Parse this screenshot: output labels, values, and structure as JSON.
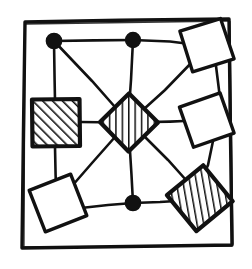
{
  "figure": {
    "title": "Hand-drawn graph of nine nodes on a three-by-three lattice",
    "caption": "",
    "width": 252,
    "height": 269,
    "background_color": "#ffffff",
    "ink_color": "#111111"
  },
  "frame": {
    "name": "hand-drawn outer border",
    "stroke_color": "#111111",
    "stroke_width": 3.2,
    "points": "25,22 229,19 232,245 22,248"
  },
  "style": {
    "edge_color": "#111111",
    "edge_width": 2.6,
    "node_outline_color": "#111111",
    "node_outline_width": 3.4,
    "hatch_color": "#111111",
    "hatch_width": 2.4,
    "white_fill": "#ffffff",
    "circle_fill": "#111111"
  },
  "nodes": [
    {
      "id": "n1",
      "label": "top-left circle node",
      "shape": "circle",
      "fill": "solid-black",
      "cx": 54,
      "cy": 41,
      "r": 7.5
    },
    {
      "id": "n2",
      "label": "top-center circle node",
      "shape": "circle",
      "fill": "solid-black",
      "cx": 133,
      "cy": 40,
      "r": 7.5
    },
    {
      "id": "n3",
      "label": "top-right white square node",
      "shape": "square",
      "fill": "white",
      "cx": 207,
      "cy": 45,
      "size": 44,
      "rotation": -18
    },
    {
      "id": "n4",
      "label": "left-middle hatched square node",
      "shape": "square",
      "fill": "hatched",
      "hatch_angle": 45,
      "cx": 56,
      "cy": 123,
      "size": 47,
      "rotation": 0
    },
    {
      "id": "n5",
      "label": "center hatched diamond node",
      "shape": "square",
      "fill": "hatched",
      "hatch_angle": 90,
      "cx": 129,
      "cy": 122,
      "size": 41,
      "rotation": 45
    },
    {
      "id": "n6",
      "label": "right-middle white square node",
      "shape": "square",
      "fill": "white",
      "cx": 207,
      "cy": 120,
      "size": 44,
      "rotation": -20
    },
    {
      "id": "n7",
      "label": "bottom-left white square node",
      "shape": "square",
      "fill": "white",
      "cx": 58,
      "cy": 203,
      "size": 45,
      "rotation": -22
    },
    {
      "id": "n8",
      "label": "bottom-center circle node",
      "shape": "circle",
      "fill": "solid-black",
      "cx": 133,
      "cy": 203,
      "r": 7.5
    },
    {
      "id": "n9",
      "label": "bottom-right hatched square node",
      "shape": "square",
      "fill": "hatched",
      "hatch_angle": 70,
      "cx": 200,
      "cy": 198,
      "size": 47,
      "rotation": -40
    }
  ],
  "edges": [
    {
      "id": "e1",
      "label": "top-left to top-center",
      "from": "n1",
      "to": "n2"
    },
    {
      "id": "e2",
      "label": "top-center to top-right",
      "from": "n2",
      "to": "n3"
    },
    {
      "id": "e3",
      "label": "top-left to left-middle",
      "from": "n1",
      "to": "n4"
    },
    {
      "id": "e4",
      "label": "top-center to center",
      "from": "n2",
      "to": "n5"
    },
    {
      "id": "e5",
      "label": "top-right to right-middle",
      "from": "n3",
      "to": "n6"
    },
    {
      "id": "e6",
      "label": "left-middle to center",
      "from": "n4",
      "to": "n5"
    },
    {
      "id": "e7",
      "label": "center to right-middle",
      "from": "n5",
      "to": "n6"
    },
    {
      "id": "e8",
      "label": "left-middle to bottom-left",
      "from": "n4",
      "to": "n7"
    },
    {
      "id": "e9",
      "label": "center to bottom-center",
      "from": "n5",
      "to": "n8"
    },
    {
      "id": "e10",
      "label": "right-middle to bottom-right",
      "from": "n6",
      "to": "n9"
    },
    {
      "id": "e11",
      "label": "bottom-left to bottom-center",
      "from": "n7",
      "to": "n8"
    },
    {
      "id": "e12",
      "label": "bottom-center to bottom-right",
      "from": "n8",
      "to": "n9"
    },
    {
      "id": "e13",
      "label": "top-left to center diagonal",
      "from": "n1",
      "to": "n5"
    },
    {
      "id": "e14",
      "label": "top-right to center diagonal",
      "from": "n3",
      "to": "n5"
    },
    {
      "id": "e15",
      "label": "center to bottom-left diagonal",
      "from": "n5",
      "to": "n7"
    },
    {
      "id": "e16",
      "label": "center to bottom-right diagonal",
      "from": "n5",
      "to": "n9"
    }
  ]
}
